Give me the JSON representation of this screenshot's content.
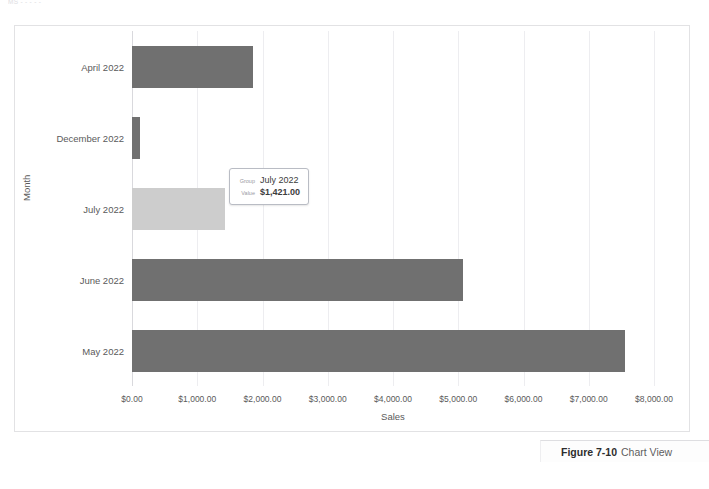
{
  "scan_header": "MS  -  -            -       -        -",
  "chart_data": {
    "type": "bar",
    "orientation": "horizontal",
    "title": "",
    "xlabel": "Sales",
    "ylabel": "Month",
    "categories": [
      "April 2022",
      "December 2022",
      "July 2022",
      "June 2022",
      "May 2022"
    ],
    "values": [
      1850,
      120,
      1421,
      5080,
      7560
    ],
    "xlim": [
      0,
      8000
    ],
    "xtick_labels": [
      "$0.00",
      "$1,000.00",
      "$2,000.00",
      "$3,000.00",
      "$4,000.00",
      "$5,000.00",
      "$6,000.00",
      "$7,000.00",
      "$8,000.00"
    ],
    "xticks": [
      0,
      1000,
      2000,
      3000,
      4000,
      5000,
      6000,
      7000,
      8000
    ],
    "grid": true,
    "legend": "none",
    "bar_color": "#707070",
    "highlight_color": "#cdcdcd",
    "highlighted_category": "July 2022"
  },
  "tooltip": {
    "group_key": "Group",
    "group_value": "July 2022",
    "value_key": "Value",
    "value_value": "$1,421.00"
  },
  "caption": {
    "number": "Figure 7-10",
    "text": "Chart View"
  }
}
